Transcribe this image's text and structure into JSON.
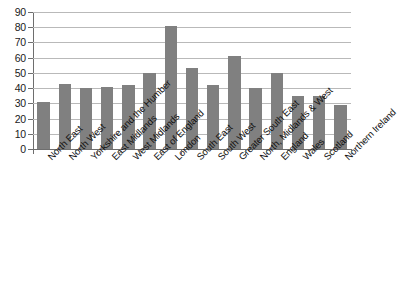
{
  "chart_data": {
    "type": "bar",
    "title": "",
    "subtitle": "",
    "xlabel": "",
    "ylabel": "",
    "ylim": [
      0,
      90
    ],
    "y_ticks": [
      0,
      10,
      20,
      30,
      40,
      50,
      60,
      70,
      80,
      90
    ],
    "grid": true,
    "legend": false,
    "legend_position": "none",
    "bar_color": "#808080",
    "gridline_color": "#b9b9b9",
    "axis_color": "#6e6e6e",
    "categories": [
      "North East",
      "North West",
      "Yorkshire and the Humber",
      "East Midlands",
      "West Midlands",
      "East of England",
      "London",
      "South East",
      "South West",
      "Greater South East",
      "North, Midlands & West",
      "England",
      "Wales",
      "Scotland",
      "Northern Ireland"
    ],
    "values": [
      31,
      43,
      40,
      41,
      42,
      50,
      81,
      53,
      42,
      61,
      40,
      50,
      35,
      35,
      29
    ]
  }
}
